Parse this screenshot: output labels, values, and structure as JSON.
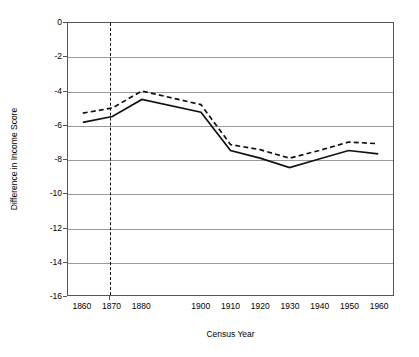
{
  "chart_data": {
    "type": "line",
    "title": "",
    "xlabel": "Census Year",
    "ylabel": "Difference in Income Score",
    "categories": [
      "1860",
      "1870",
      "1880",
      "1900",
      "1910",
      "1920",
      "1930",
      "1940",
      "1950",
      "1960"
    ],
    "x": [
      1860,
      1870,
      1880,
      1900,
      1910,
      1920,
      1930,
      1940,
      1950,
      1960
    ],
    "xlim": [
      1855,
      1965
    ],
    "ylim": [
      -16,
      0
    ],
    "yticks": [
      0,
      -2,
      -4,
      -6,
      -8,
      -10,
      -12,
      -14,
      -16
    ],
    "ytick_labels": [
      "0",
      "-2",
      "-4",
      "-6",
      "-8",
      "-10",
      "-12",
      "-14",
      "-16"
    ],
    "grid": "horizontal",
    "legend": "none",
    "series": [
      {
        "name": "solid-series",
        "style": "solid",
        "color": "#111111",
        "values": [
          -5.85,
          -5.5,
          -4.5,
          -5.25,
          -7.5,
          -7.95,
          -8.5,
          -8.0,
          -7.5,
          -7.7
        ]
      },
      {
        "name": "dashed-series",
        "style": "dashed",
        "color": "#111111",
        "values": [
          -5.3,
          -5.0,
          -4.0,
          -4.8,
          -7.15,
          -7.45,
          -7.95,
          -7.5,
          -7.0,
          -7.1
        ]
      }
    ],
    "annotations": [
      {
        "name": "vertical-reference-line",
        "type": "vline",
        "x": 1869,
        "style": "dashed",
        "color": "#111111",
        "label": ""
      }
    ]
  }
}
